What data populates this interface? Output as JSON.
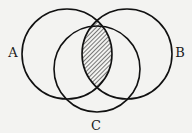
{
  "diagram": {
    "type": "venn",
    "sets": [
      {
        "id": "A",
        "label": "A",
        "cx": 67,
        "cy": 54,
        "r": 45,
        "label_x": 13,
        "label_y": 57
      },
      {
        "id": "B",
        "label": "B",
        "cx": 127,
        "cy": 54,
        "r": 45,
        "label_x": 180,
        "label_y": 57
      },
      {
        "id": "C",
        "label": "C",
        "cx": 97,
        "cy": 69,
        "r": 43,
        "label_x": 96,
        "label_y": 130
      }
    ],
    "shaded_region": "A ∩ B",
    "shading": "hatched",
    "colors": {
      "stroke": "#111111",
      "background": "#f3f3f1",
      "hatch": "#222222"
    }
  }
}
